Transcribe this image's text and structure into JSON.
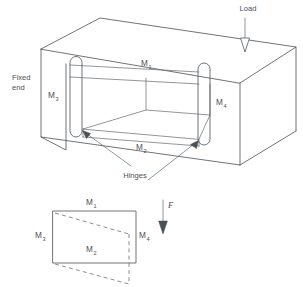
{
  "figure": {
    "upper_view": {
      "name": "isometric-box-view",
      "labels": {
        "load": "Load",
        "fixed_end_line1": "Fixed",
        "fixed_end_line2": "end",
        "hinges": "Hinges",
        "m1": "M",
        "m1_sub": "1",
        "m2": "M",
        "m2_sub": "2",
        "m3": "M",
        "m3_sub": "3",
        "m4": "M",
        "m4_sub": "4"
      }
    },
    "lower_view": {
      "name": "plan-deformed-view",
      "labels": {
        "m1": "M",
        "m1_sub": "1",
        "m2": "M",
        "m2_sub": "2",
        "m3": "M",
        "m3_sub": "3",
        "m4": "M",
        "m4_sub": "4",
        "force": "F"
      }
    },
    "colors": {
      "line": "#555b60",
      "dashed": "#6b7075",
      "text": "#4c5155",
      "background": "#ffffff",
      "arrow_fill": "#4a5055"
    }
  }
}
